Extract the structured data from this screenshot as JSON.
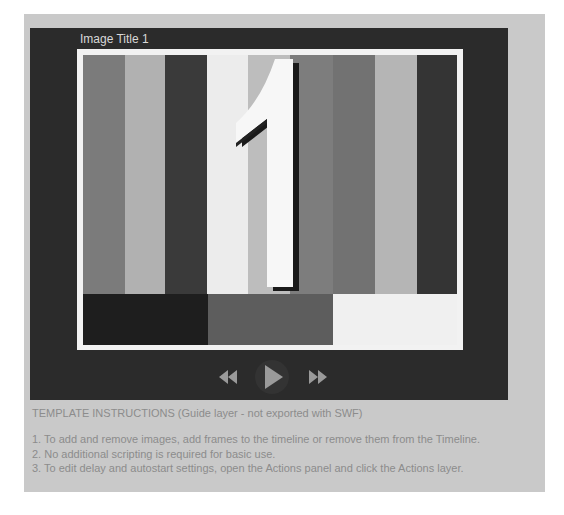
{
  "slideshow": {
    "image_title": "Image Title 1",
    "numeral": "1",
    "bars": [
      {
        "color": "#7b7b7b",
        "width": 42
      },
      {
        "color": "#b1b1b1",
        "width": 40
      },
      {
        "color": "#3a3a3a",
        "width": 42
      },
      {
        "color": "#ececec",
        "width": 41
      },
      {
        "color": "#bdbdbd",
        "width": 42
      },
      {
        "color": "#7d7d7d",
        "width": 43
      },
      {
        "color": "#727272",
        "width": 42
      },
      {
        "color": "#b5b5b5",
        "width": 42
      },
      {
        "color": "#343434",
        "width": 40
      }
    ],
    "blocks": [
      {
        "color": "#1e1e1e",
        "width": 125
      },
      {
        "color": "#5d5d5d",
        "width": 125
      },
      {
        "color": "#f0f0f0",
        "width": 124
      }
    ],
    "controls": {
      "rewind": "rewind-icon",
      "play": "play-icon",
      "fast_forward": "fast-forward-icon"
    }
  },
  "instructions": {
    "title": "TEMPLATE INSTRUCTIONS (Guide layer - not exported with SWF)",
    "items": [
      "1. To add and remove images, add frames to the timeline or remove them from the Timeline.",
      "2. No additional scripting is required for basic use.",
      "3. To edit delay and autostart settings, open the Actions panel and click the Actions layer."
    ]
  },
  "colors": {
    "panel": "#c9c9c9",
    "stage": "#2b2b2b",
    "frame": "#f2f2f2",
    "control_icon": "#9a9a9a",
    "instruction_text": "#8c8c8c"
  }
}
